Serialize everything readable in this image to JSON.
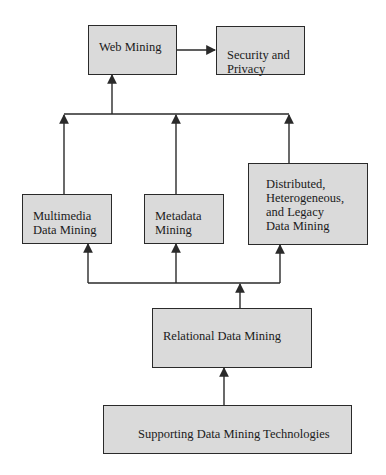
{
  "diagram": {
    "type": "flowchart",
    "direction": "bottom-to-top",
    "colors": {
      "box_fill": "#dadada",
      "box_border": "#2a2a2a",
      "line": "#2a2a2a",
      "background": "#ffffff"
    },
    "nodes": {
      "web_mining": {
        "label": "Web Mining"
      },
      "security_privacy": {
        "label": "Security and\nPrivacy"
      },
      "multimedia": {
        "label": "Multimedia\nData Mining"
      },
      "metadata": {
        "label": "Metadata\nMining"
      },
      "distributed": {
        "label": "Distributed,\nHeterogeneous,\nand Legacy\nData Mining"
      },
      "relational": {
        "label": "Relational Data Mining"
      },
      "supporting": {
        "label": "Supporting Data Mining Technologies"
      }
    },
    "edges": [
      {
        "from": "supporting",
        "to": "relational"
      },
      {
        "from": "relational",
        "to": "multimedia"
      },
      {
        "from": "relational",
        "to": "metadata"
      },
      {
        "from": "relational",
        "to": "distributed"
      },
      {
        "from": "multimedia",
        "to": "web_mining"
      },
      {
        "from": "metadata",
        "to": "web_mining"
      },
      {
        "from": "distributed",
        "to": "web_mining"
      },
      {
        "from": "web_mining",
        "to": "security_privacy"
      }
    ]
  }
}
